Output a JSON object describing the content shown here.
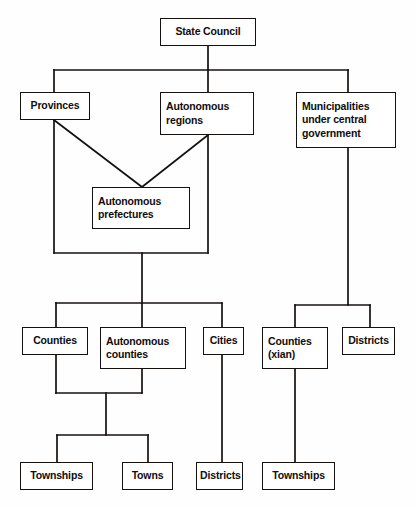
{
  "diagram": {
    "type": "organizational-hierarchy",
    "background_color": "#fefefe",
    "line_color": "#14110f",
    "box_fill": "#ffffff",
    "nodes": [
      {
        "id": "state-council",
        "label": "State Council",
        "x": 160,
        "y": 18,
        "w": 96,
        "h": 28,
        "align": "center"
      },
      {
        "id": "provinces",
        "label": "Provinces",
        "x": 20,
        "y": 92,
        "w": 70,
        "h": 28,
        "align": "center"
      },
      {
        "id": "autonomous-regions",
        "label": "Autonomous\nregions",
        "x": 160,
        "y": 92,
        "w": 94,
        "h": 43,
        "align": "left"
      },
      {
        "id": "municipalities",
        "label": "Municipalities\nunder central\ngovernment",
        "x": 296,
        "y": 92,
        "w": 100,
        "h": 56,
        "align": "left"
      },
      {
        "id": "autonomous-prefectures",
        "label": "Autonomous\nprefectures",
        "x": 92,
        "y": 187,
        "w": 98,
        "h": 42,
        "align": "left"
      },
      {
        "id": "counties",
        "label": "Counties",
        "x": 22,
        "y": 327,
        "w": 66,
        "h": 28,
        "align": "center"
      },
      {
        "id": "autonomous-counties",
        "label": "Autonomous\ncounties",
        "x": 100,
        "y": 327,
        "w": 86,
        "h": 42,
        "align": "left"
      },
      {
        "id": "cities",
        "label": "Cities",
        "x": 203,
        "y": 327,
        "w": 41,
        "h": 28,
        "align": "center"
      },
      {
        "id": "counties-xian",
        "label": "Counties\n(xian)",
        "x": 262,
        "y": 327,
        "w": 66,
        "h": 42,
        "align": "left"
      },
      {
        "id": "districts-municipal",
        "label": "Districts",
        "x": 342,
        "y": 327,
        "w": 53,
        "h": 28,
        "align": "center"
      },
      {
        "id": "townships-left",
        "label": "Townships",
        "x": 20,
        "y": 462,
        "w": 73,
        "h": 28,
        "align": "center"
      },
      {
        "id": "towns",
        "label": "Towns",
        "x": 122,
        "y": 462,
        "w": 51,
        "h": 28,
        "align": "center"
      },
      {
        "id": "districts-city",
        "label": "Districts",
        "x": 196,
        "y": 462,
        "w": 47,
        "h": 28,
        "align": "center"
      },
      {
        "id": "townships-right",
        "label": "Townships",
        "x": 262,
        "y": 462,
        "w": 73,
        "h": 28,
        "align": "center"
      }
    ],
    "connectors": [
      {
        "id": "state-council-stem",
        "points": "208,46 208,70"
      },
      {
        "id": "top-bus",
        "points": "54,70 348,70"
      },
      {
        "id": "bus-to-provinces",
        "points": "54,70 54,92"
      },
      {
        "id": "bus-to-autonomous-regions",
        "points": "208,70 208,92"
      },
      {
        "id": "bus-to-municipalities",
        "points": "348,70 348,92"
      },
      {
        "id": "provinces-diagonal",
        "points": "54,120 142,187"
      },
      {
        "id": "autonomous-regions-diagonal",
        "points": "208,135 142,187"
      },
      {
        "id": "provinces-down",
        "points": "54,120 54,253"
      },
      {
        "id": "autonomous-regions-down",
        "points": "208,135 208,253"
      },
      {
        "id": "provincial-merge-bus",
        "points": "54,253 208,253"
      },
      {
        "id": "provincial-stem",
        "points": "142,253 142,303"
      },
      {
        "id": "county-level-bus",
        "points": "56,303 222,303"
      },
      {
        "id": "bus-to-counties",
        "points": "56,303 56,327"
      },
      {
        "id": "bus-to-autonomous-counties",
        "points": "142,303 142,327"
      },
      {
        "id": "bus-to-cities",
        "points": "222,303 222,327"
      },
      {
        "id": "counties-down",
        "points": "56,355 56,393"
      },
      {
        "id": "autonomous-counties-down",
        "points": "142,369 142,393"
      },
      {
        "id": "county-merge-bus",
        "points": "56,393 142,393"
      },
      {
        "id": "county-merge-stem",
        "points": "106,393 106,435"
      },
      {
        "id": "township-bus",
        "points": "57,435 148,435"
      },
      {
        "id": "bus-to-townships-left",
        "points": "57,435 57,462"
      },
      {
        "id": "bus-to-towns",
        "points": "148,435 148,462"
      },
      {
        "id": "cities-to-districts",
        "points": "222,355 222,462"
      },
      {
        "id": "municipalities-down",
        "points": "348,148 348,305"
      },
      {
        "id": "municipal-bus",
        "points": "295,305 370,305"
      },
      {
        "id": "bus-to-counties-xian",
        "points": "295,305 295,327"
      },
      {
        "id": "bus-to-districts-municipal",
        "points": "370,305 370,327"
      },
      {
        "id": "counties-xian-to-townships",
        "points": "295,369 295,462"
      }
    ]
  }
}
